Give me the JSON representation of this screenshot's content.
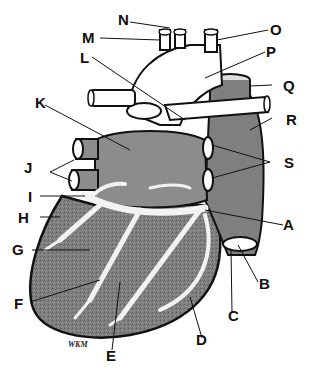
{
  "diagram": {
    "signature": "WKM",
    "colors": {
      "outline": "#111111",
      "atrium_fill": "#8c8c8c",
      "ventricle_fill": "#7a7a7a",
      "vessel_fill": "#ffffff",
      "vein_fill": "#7f7f7f"
    },
    "labels": [
      {
        "letter": "A"
      },
      {
        "letter": "B"
      },
      {
        "letter": "C"
      },
      {
        "letter": "D"
      },
      {
        "letter": "E"
      },
      {
        "letter": "F"
      },
      {
        "letter": "G"
      },
      {
        "letter": "H"
      },
      {
        "letter": "I"
      },
      {
        "letter": "J"
      },
      {
        "letter": "K"
      },
      {
        "letter": "L"
      },
      {
        "letter": "M"
      },
      {
        "letter": "N"
      },
      {
        "letter": "O"
      },
      {
        "letter": "P"
      },
      {
        "letter": "Q"
      },
      {
        "letter": "R"
      },
      {
        "letter": "S"
      }
    ]
  }
}
